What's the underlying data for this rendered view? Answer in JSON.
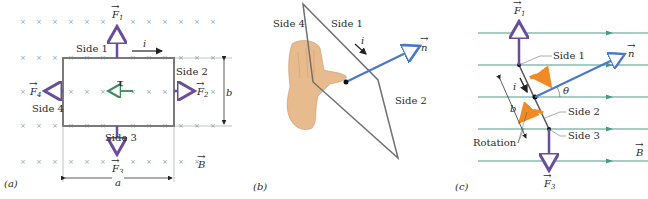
{
  "panels": {
    "a": {
      "tag": "(a)",
      "sides": [
        "Side 1",
        "Side 2",
        "Side 3",
        "Side 4"
      ],
      "forces": [
        "F1",
        "F2",
        "F3",
        "F4"
      ],
      "force_sub": [
        "1",
        "2",
        "3",
        "4"
      ],
      "F": "F",
      "current": "i",
      "torque": "τ",
      "field": "B",
      "dim_a": "a",
      "dim_b": "b"
    },
    "b": {
      "tag": "(b)",
      "sides": [
        "Side 4",
        "Side 1",
        "Side 2"
      ],
      "current": "i",
      "normal": "n"
    },
    "c": {
      "tag": "(c)",
      "sides": [
        "Side 1",
        "Side 2",
        "Side 3"
      ],
      "F": "F",
      "force_sub": [
        "1",
        "3"
      ],
      "current": "i",
      "normal": "n",
      "angle": "θ",
      "dim_b": "b",
      "rotation": "Rotation",
      "field": "B"
    }
  },
  "colors": {
    "force": "#6a4c9c",
    "torque": "#3d8a5a",
    "field_line": "#4a9a86",
    "normal": "#4a78c8",
    "rotation": "#f08a24",
    "loop": "#7a7a7a",
    "hand": "#e8bb8e"
  }
}
